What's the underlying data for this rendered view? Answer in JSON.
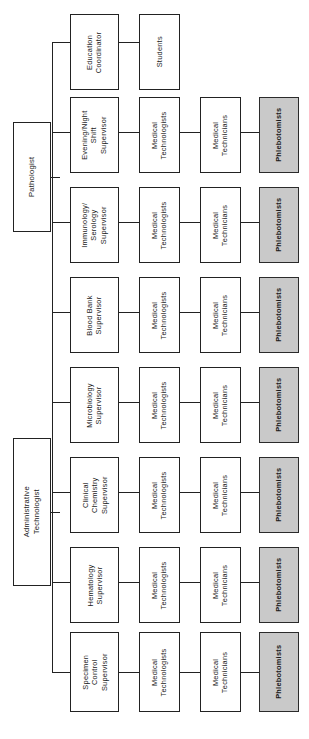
{
  "diagram": {
    "orientation": "rotated-90-ccw",
    "background_color": "#ffffff",
    "line_color": "#222222",
    "box_fill_color": "#ffffff",
    "box_border_color": "#222222",
    "shaded_fill_color": "#c9c9c9",
    "shaded_border_color": "#2b2b2b"
  },
  "roots": {
    "pathologist": {
      "label": "Pathologist"
    },
    "administrative_technologist": {
      "label": "Administrative Technologist"
    }
  },
  "branches": [
    {
      "supervisor": "Education\nCoordinator",
      "level2": "Students",
      "level3": null,
      "level4": null
    },
    {
      "supervisor": "Evening/Night\nShift\nSupervisor",
      "level2": "Medical\nTechnologists",
      "level3": "Medical\nTechnicians",
      "level4": "Phlebotomists"
    },
    {
      "supervisor": "Immunology/\nSerology\nSupervisor",
      "level2": "Medical\nTechnologists",
      "level3": "Medical\nTechnicians",
      "level4": "Phlebotomists"
    },
    {
      "supervisor": "Blood Bank\nSupervisor",
      "level2": "Medical\nTechnologists",
      "level3": "Medical\nTechnicians",
      "level4": "Phlebotomists"
    },
    {
      "supervisor": "Microbiology\nSupervisor",
      "level2": "Medical\nTechnologists",
      "level3": "Medical\nTechnicians",
      "level4": "Phlebotomists"
    },
    {
      "supervisor": "Clinical\nChemistry\nSupervisor",
      "level2": "Medical\nTechnologists",
      "level3": "Medical\nTechnicians",
      "level4": "Phlebotomists"
    },
    {
      "supervisor": "Hematology\nSupervisor",
      "level2": "Medical\nTechnologists",
      "level3": "Medical\nTechnicians",
      "level4": "Phlebotomists"
    },
    {
      "supervisor": "Specimen\nControl\nSupervisor",
      "level2": "Medical\nTechnologists",
      "level3": "Medical\nTechnicians",
      "level4": "Phlebotomists"
    }
  ]
}
